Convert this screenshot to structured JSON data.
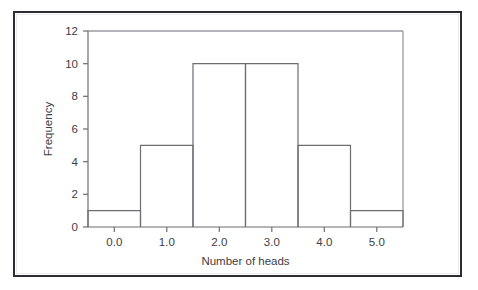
{
  "chart_data": {
    "type": "bar",
    "title": "",
    "subtitle": "",
    "xlabel": "Number of heads",
    "ylabel": "Frequency",
    "categories": [
      "0",
      "1",
      "2",
      "3",
      "4",
      "5"
    ],
    "values": [
      1,
      5,
      10,
      10,
      5,
      1
    ],
    "bin_edges": [
      -0.5,
      0.5,
      1.5,
      2.5,
      3.5,
      4.5,
      5.5
    ],
    "xlim": [
      -0.5,
      5.5
    ],
    "ylim": [
      0,
      12
    ],
    "xticks": [
      0,
      1,
      2,
      3,
      4,
      5
    ],
    "xtick_labels": [
      "0.0",
      "1.0",
      "2.0",
      "3.0",
      "4.0",
      "5.0"
    ],
    "yticks": [
      0,
      2,
      4,
      6,
      8,
      10,
      12
    ],
    "ytick_labels": [
      "0",
      "2",
      "4",
      "6",
      "8",
      "10",
      "12"
    ],
    "grid": false,
    "legend": null,
    "bar_fill": "none",
    "bar_stroke": "#6d6d72",
    "axis_color": "#6d6d72",
    "text_color": "#3d3d44",
    "background": "#ffffff"
  },
  "figure": {
    "frame_color": "#2b2b33",
    "y_axis_title": "Frequency",
    "x_axis_title": "Number of heads"
  }
}
